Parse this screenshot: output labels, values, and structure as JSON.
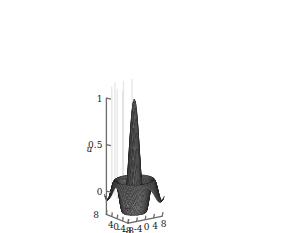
{
  "figure": {
    "kind": "surface-mesh-3d",
    "background_color": "#ffffff",
    "mesh_line_color": "#1c1c1c",
    "mesh_face_color": "#8a8a8a",
    "axis_color": "#6b6b6b",
    "gridline_color": "#e4e4e4",
    "text_color": "#1a1a1a"
  },
  "axes": {
    "x": {
      "label": "x",
      "ticks": [
        "-8",
        "-4",
        "0",
        "4",
        "8"
      ],
      "tick_values": [
        -8,
        -4,
        0,
        4,
        8
      ],
      "range": [
        -8,
        8
      ]
    },
    "y": {
      "label": "y",
      "ticks": [
        "8",
        "4",
        "0",
        "-4",
        "-8"
      ],
      "tick_values": [
        8,
        4,
        0,
        -4,
        -8
      ],
      "range": [
        -8,
        8
      ]
    },
    "z": {
      "label": "u",
      "ticks": [
        "0",
        "0.5",
        "1"
      ],
      "tick_values": [
        0,
        0.5,
        1
      ],
      "range": [
        -0.25,
        1
      ]
    }
  },
  "chart_data": {
    "type": "surface",
    "title": "",
    "xlabel": "x",
    "ylabel": "y",
    "zlabel": "u",
    "xlim": [
      -8,
      8
    ],
    "ylim": [
      -8,
      8
    ],
    "zlim": [
      -0.25,
      1
    ],
    "grid": true,
    "legend": false,
    "function": "u(x,y) = sin(r)/r, r = sqrt(x^2 + y^2)",
    "samples": 41,
    "view_azimuth": -37.5,
    "view_elevation": 30,
    "key_points": [
      {
        "x": 0,
        "y": 0,
        "u": 1.0
      },
      {
        "x": 3.14,
        "y": 0,
        "u": 0.0
      },
      {
        "x": 4.49,
        "y": 0,
        "u": -0.217
      },
      {
        "x": 6.28,
        "y": 0,
        "u": 0.0
      },
      {
        "x": 7.73,
        "y": 0,
        "u": 0.128
      },
      {
        "x": 8,
        "y": 8,
        "u": 0.08
      }
    ]
  }
}
